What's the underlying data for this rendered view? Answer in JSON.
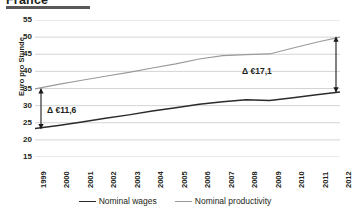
{
  "title": "France",
  "legend": {
    "position": "bottom",
    "items": [
      {
        "label": "Nominal wages",
        "color": "#2b2b2b",
        "key": "wages"
      },
      {
        "label": "Nominal productivity",
        "color": "#9a9a9a",
        "key": "productivity"
      }
    ]
  },
  "annotations": [
    {
      "name": "delta-1999",
      "text": "Δ €11,6",
      "year": "1999"
    },
    {
      "name": "delta-2012",
      "text": "Δ €17,1",
      "year": "2012"
    }
  ],
  "chart_data": {
    "type": "line",
    "title": "France",
    "xlabel": "",
    "ylabel": "Euro pro Stunde",
    "categories": [
      "1999",
      "2000",
      "2001",
      "2002",
      "2003",
      "2004",
      "2005",
      "2006",
      "2007",
      "2008",
      "2009",
      "2010",
      "2011",
      "2012"
    ],
    "ylim": [
      15,
      55
    ],
    "yticks": [
      15,
      20,
      25,
      30,
      35,
      40,
      45,
      50,
      55
    ],
    "grid": true,
    "series": [
      {
        "name": "Nominal productivity",
        "color": "#9a9a9a",
        "values": [
          34.9,
          36.2,
          37.4,
          38.6,
          39.7,
          41.0,
          42.2,
          43.6,
          44.6,
          44.9,
          45.1,
          46.8,
          48.5,
          50.0
        ]
      },
      {
        "name": "Nominal wages",
        "color": "#2b2b2b",
        "values": [
          23.3,
          24.2,
          25.2,
          26.3,
          27.3,
          28.4,
          29.4,
          30.4,
          31.1,
          31.7,
          31.5,
          32.3,
          33.2,
          34.0
        ]
      }
    ],
    "deltas": [
      {
        "year": "1999",
        "label": "Δ €11,6",
        "value": 11.6
      },
      {
        "year": "2012",
        "label": "Δ €17,1",
        "value": 17.1
      }
    ]
  }
}
